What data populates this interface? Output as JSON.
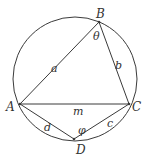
{
  "diagram": {
    "stroke_color": "#3a3a3a",
    "circle": {
      "cx": 75,
      "cy": 79,
      "r": 62
    },
    "points": {
      "A": {
        "label": "A",
        "x": 20,
        "y": 104
      },
      "B": {
        "label": "B",
        "x": 99,
        "y": 22
      },
      "C": {
        "label": "C",
        "x": 129,
        "y": 104
      },
      "D": {
        "label": "D",
        "x": 74,
        "y": 139
      }
    },
    "sides": {
      "a": {
        "label": "a",
        "from": "A",
        "to": "B"
      },
      "b": {
        "label": "b",
        "from": "B",
        "to": "C"
      },
      "c": {
        "label": "c",
        "from": "C",
        "to": "D"
      },
      "d": {
        "label": "d",
        "from": "D",
        "to": "A"
      },
      "m": {
        "label": "m",
        "from": "A",
        "to": "C"
      }
    },
    "angles": {
      "theta": {
        "label": "θ",
        "at": "B"
      },
      "phi": {
        "label": "φ",
        "at": "D"
      }
    }
  }
}
